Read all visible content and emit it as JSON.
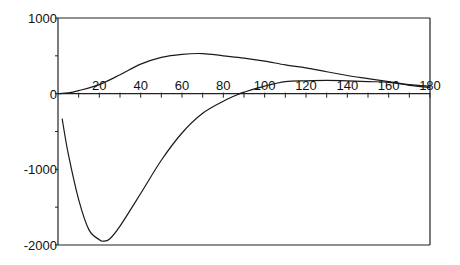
{
  "chart_data": {
    "type": "line",
    "title": "",
    "xlabel": "",
    "ylabel": "",
    "xlim": [
      0,
      180
    ],
    "ylim": [
      -2000,
      1000
    ],
    "grid": false,
    "legend": null,
    "x_ticks": [
      "20",
      "40",
      "60",
      "80",
      "100",
      "120",
      "140",
      "160",
      "180"
    ],
    "y_ticks": [
      "1000",
      "0",
      "-1000",
      "-2000"
    ],
    "series": [
      {
        "name": "upper curve",
        "x": [
          0,
          5,
          10,
          20,
          30,
          40,
          50,
          60,
          70,
          80,
          90,
          100,
          110,
          120,
          130,
          140,
          150,
          160,
          170,
          180
        ],
        "values": [
          0,
          10,
          40,
          120,
          250,
          390,
          480,
          520,
          530,
          500,
          470,
          430,
          380,
          340,
          290,
          240,
          200,
          160,
          120,
          100
        ]
      },
      {
        "name": "lower curve",
        "x": [
          2,
          5,
          10,
          15,
          20,
          22,
          25,
          30,
          40,
          50,
          60,
          70,
          80,
          88,
          90,
          100,
          110,
          120,
          130,
          140,
          150,
          160,
          170,
          180
        ],
        "values": [
          -330,
          -800,
          -1400,
          -1800,
          -1930,
          -1950,
          -1920,
          -1750,
          -1320,
          -880,
          -520,
          -260,
          -100,
          0,
          20,
          100,
          160,
          170,
          175,
          170,
          160,
          150,
          110,
          80
        ]
      }
    ]
  }
}
